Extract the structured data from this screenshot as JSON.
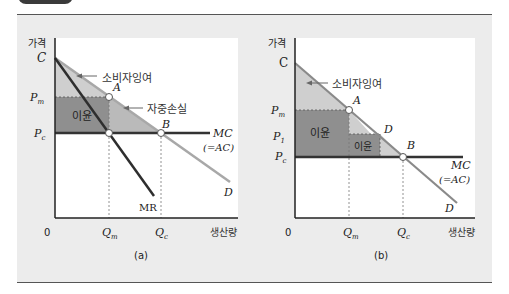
{
  "colors": {
    "background": "#ececec",
    "plot_area": "#ffffff",
    "consumer_surplus": "#c9c9c9",
    "profit": "#8d8d8d",
    "deadweight_loss": "#b5b5b5",
    "demand_line": "#a8a8a8",
    "mc_line": "#333333",
    "mr_line": "#2e2e2e",
    "frame_border": "#555555"
  },
  "panel_a": {
    "caption": "(a)",
    "y_axis_label": "가격",
    "x_axis_label": "생산량",
    "origin": "0",
    "price_labels": {
      "C": "C",
      "Pm": "P",
      "Pm_sub": "m",
      "Pc": "P",
      "Pc_sub": "c"
    },
    "quantity_labels": {
      "Qm": "Q",
      "Qm_sub": "m",
      "Qc": "Q",
      "Qc_sub": "c"
    },
    "points": {
      "A": "A",
      "B": "B"
    },
    "curves": {
      "MC": "MC",
      "AC": "(=AC)",
      "D": "D",
      "MR": "MR"
    },
    "annotations": {
      "consumer_surplus": "소비자잉여",
      "deadweight_loss": "자중손실",
      "profit": "이윤"
    }
  },
  "panel_b": {
    "caption": "(b)",
    "y_axis_label": "가격",
    "x_axis_label": "생산량",
    "origin": "0",
    "price_labels": {
      "C": "C",
      "Pm": "P",
      "Pm_sub": "m",
      "P1": "P",
      "P1_sub": "1",
      "Pc": "P",
      "Pc_sub": "c"
    },
    "quantity_labels": {
      "Qm": "Q",
      "Qm_sub": "m",
      "Qc": "Q",
      "Qc_sub": "c"
    },
    "points": {
      "A": "A",
      "B": "B"
    },
    "curves": {
      "MC": "MC",
      "AC": "(=AC)",
      "D_mid": "D",
      "D": "D"
    },
    "annotations": {
      "consumer_surplus": "소비자잉여",
      "profit_1": "이윤",
      "profit_2": "이윤"
    }
  }
}
